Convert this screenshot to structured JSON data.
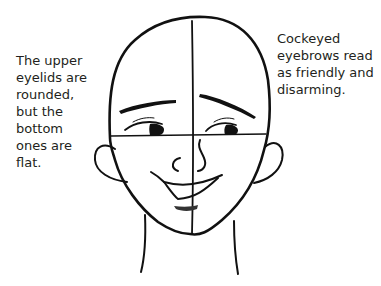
{
  "figure": {
    "ink_color": "#111111",
    "background": "#ffffff"
  },
  "captions": {
    "left": "The upper\neyelids are\nrounded,\nbut the\nbottom\nones are\nflat.",
    "right": "Cockeyed\neyebrows read\nas friendly and\ndisarming."
  },
  "parts": {
    "head_outline": "head-outline",
    "vertical_guide": "vertical-center-line",
    "horizontal_guide": "eye-line",
    "eyebrows": [
      "left-eyebrow",
      "right-eyebrow"
    ],
    "eyes": [
      "left-eye",
      "right-eye"
    ],
    "nose": "nose",
    "mouth": "smile",
    "lower_lip": "lower-lip",
    "ears": [
      "left-ear",
      "right-ear"
    ],
    "neck": "neck"
  }
}
